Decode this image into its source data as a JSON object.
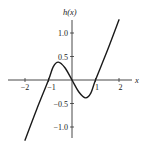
{
  "chart_data": {
    "type": "line",
    "title": "",
    "xlabel": "x",
    "ylabel": "h(x)",
    "xlim": [
      -2.2,
      2.5
    ],
    "ylim": [
      -1.3,
      1.3
    ],
    "grid": false,
    "legend": null,
    "x_ticks": [
      -2,
      -1,
      1,
      2
    ],
    "x_tick_labels": [
      "−2",
      "−1",
      "1",
      "2"
    ],
    "y_ticks": [
      1.0,
      0.5,
      -0.5,
      -1.0
    ],
    "y_tick_labels": [
      "1.0",
      "0.5",
      "−0.5",
      "−1.0"
    ],
    "series": [
      {
        "name": "h(x)",
        "x": [
          -2.0,
          -1.5,
          -1.0,
          -0.8,
          -0.58,
          -0.3,
          0.0,
          0.3,
          0.58,
          0.8,
          1.0,
          1.5,
          2.0
        ],
        "y": [
          -1.28,
          -0.62,
          0.0,
          0.28,
          0.38,
          0.26,
          0.0,
          -0.26,
          -0.38,
          -0.28,
          0.0,
          0.62,
          1.28
        ]
      }
    ],
    "features": {
      "zeros": [
        -1,
        0,
        1
      ],
      "local_max": {
        "x": -0.58,
        "y": 0.38
      },
      "local_min": {
        "x": 0.58,
        "y": -0.38
      }
    }
  },
  "colors": {
    "curve": "#1a1a1a",
    "axis": "#333333",
    "background": "#ffffff"
  }
}
